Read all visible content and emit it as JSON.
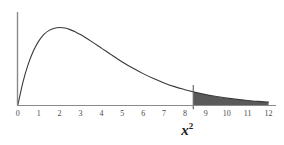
{
  "chart_data": {
    "type": "line",
    "title": "",
    "subtitle": "",
    "xlabel": "x2",
    "ylabel": "",
    "xlim": [
      0,
      12
    ],
    "ylim": [
      0,
      0.21
    ],
    "grid": false,
    "legend": null,
    "xticks": [
      "0",
      "1",
      "2",
      "3",
      "4",
      "5",
      "6",
      "7",
      "8",
      "9",
      "10",
      "11",
      "12"
    ],
    "xtick_values": [
      0,
      1,
      2,
      3,
      4,
      5,
      6,
      7,
      8,
      9,
      10,
      11,
      12
    ],
    "yticks": [],
    "distribution": "chi-square density, df = 4",
    "series": [
      {
        "name": "chi-square density",
        "x": [
          0,
          0.25,
          0.5,
          0.75,
          1,
          1.25,
          1.5,
          1.75,
          2,
          2.25,
          2.5,
          2.75,
          3,
          3.5,
          4,
          4.5,
          5,
          5.5,
          6,
          6.5,
          7,
          7.5,
          8,
          8.4,
          9,
          9.5,
          10,
          10.5,
          11,
          11.5,
          12
        ],
        "y": [
          0,
          0.0221,
          0.0389,
          0.0515,
          0.0607,
          0.0671,
          0.0709,
          0.0729,
          0.0736,
          0.0731,
          0.0716,
          0.0695,
          0.0669,
          0.0607,
          0.0541,
          0.0474,
          0.041,
          0.0352,
          0.0299,
          0.0252,
          0.0211,
          0.0176,
          0.0147,
          0.0126,
          0.01,
          0.0083,
          0.0067,
          0.0055,
          0.0045,
          0.0036,
          0.003
        ]
      }
    ],
    "shaded_region": {
      "label": "right tail rejection region",
      "from": 8.4,
      "to": 12,
      "color": "#5a5a5a"
    },
    "critical_line": {
      "label": "critical value",
      "x": 8.4,
      "color": "#6b6b6b"
    },
    "colors": {
      "background": "#ffffff",
      "axis": "#8a8a8a",
      "curve": "#3a3a3a",
      "shading": "#5a5a5a",
      "tick_text": "#4a4a4a",
      "title_text": "#1c1c1c"
    },
    "axis_title_parts": {
      "base": "x",
      "exponent": "2"
    }
  }
}
